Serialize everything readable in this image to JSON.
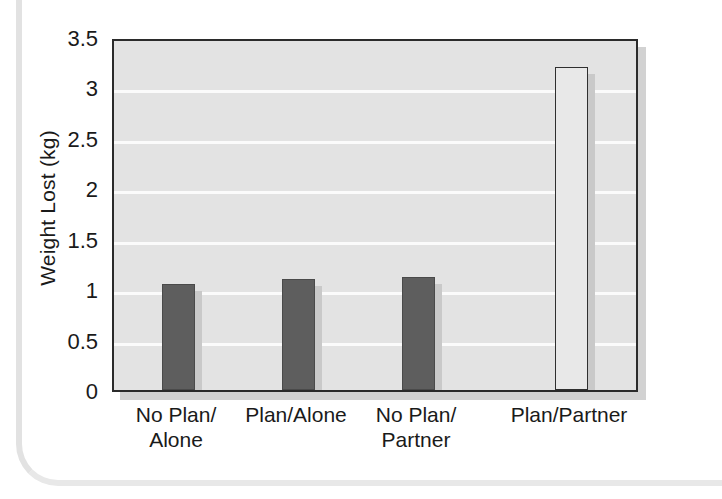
{
  "chart_data": {
    "type": "bar",
    "title": "",
    "xlabel": "",
    "ylabel": "Weight Lost (kg)",
    "ylim": [
      0,
      3.5
    ],
    "grid": true,
    "legend": "none",
    "categories": [
      "No Plan/\nAlone",
      "Plan/Alone",
      "No Plan/\nPartner",
      "Plan/Partner"
    ],
    "values": [
      1.05,
      1.1,
      1.12,
      3.2
    ],
    "bar_styles": [
      "dark",
      "dark",
      "dark",
      "light"
    ],
    "y_ticks": [
      "0",
      "0.5",
      "1",
      "1.5",
      "2",
      "2.5",
      "3",
      "3.5"
    ],
    "y_tick_values": [
      0,
      0.5,
      1,
      1.5,
      2,
      2.5,
      3,
      3.5
    ],
    "colors": {
      "bar_dark": "#5e5e5e",
      "bar_light": "#e8e8e8",
      "plot_background": "#e3e3e3",
      "gridline": "#fbfbfb",
      "axis": "#2b2b2b",
      "shadow": "#c9c9c9",
      "text": "#1a1a1a"
    }
  }
}
